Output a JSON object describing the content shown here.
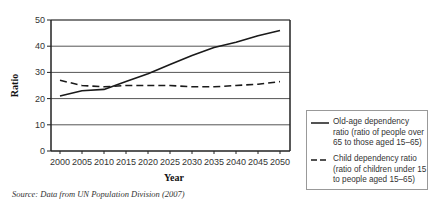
{
  "chart_data": {
    "type": "line",
    "title": "",
    "xlabel": "Year",
    "ylabel": "Ratio",
    "ylim": [
      0,
      50
    ],
    "yticks": [
      0,
      10,
      20,
      30,
      40,
      50
    ],
    "x": [
      2000,
      2005,
      2010,
      2015,
      2020,
      2025,
      2030,
      2035,
      2040,
      2045,
      2050
    ],
    "grid": "horizontal",
    "legend_position": "right-bottom",
    "series": [
      {
        "name": "Old-age dependency ratio (ratio of people over 65 to those aged 15–65)",
        "style": "solid",
        "values": [
          21,
          23,
          23.5,
          26.5,
          29.5,
          33,
          36.5,
          39.5,
          41.5,
          44,
          46
        ]
      },
      {
        "name": "Child dependency ratio (ratio of children under 15 to people aged 15–65)",
        "style": "dashed",
        "values": [
          27,
          25,
          24.5,
          25,
          25,
          25,
          24.5,
          24.5,
          25,
          25.5,
          26.5
        ]
      }
    ]
  },
  "labels": {
    "x_axis_title": "Year",
    "y_axis_title": "Ratio",
    "legend_old_age": "Old-age dependency ratio (ratio of people over 65 to those aged 15–65)",
    "legend_child": "Child dependency ratio (ratio of children under 15 to people aged 15–65)",
    "source": "Source: Data from UN Population Division (2007)"
  },
  "colors": {
    "line": "#1a1a1a",
    "grid": "#555555",
    "axis": "#222222"
  }
}
